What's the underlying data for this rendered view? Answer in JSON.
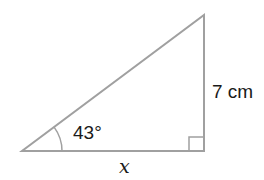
{
  "diagram": {
    "type": "right-triangle",
    "stroke_color": "#a0a0a0",
    "text_color": "#1a1a1a",
    "vertices": {
      "acute_angle_vertex": [
        22,
        151
      ],
      "right_angle_vertex": [
        204,
        151
      ],
      "top_vertex": [
        204,
        15
      ]
    },
    "labels": {
      "angle": "43°",
      "opposite_side": "7 cm",
      "adjacent_side": "x"
    }
  }
}
